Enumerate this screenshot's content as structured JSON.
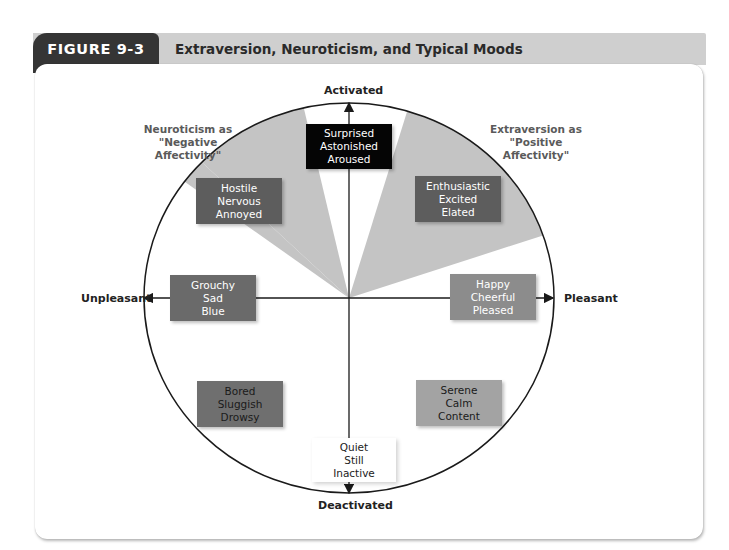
{
  "figure": {
    "number_label": "FIGURE 9-3",
    "title": "Extraversion, Neuroticism, and Typical Moods"
  },
  "axes": {
    "top": "Activated",
    "bottom": "Deactivated",
    "left": "Unpleasant",
    "right": "Pleasant"
  },
  "annotations": {
    "neuroticism": [
      "Neuroticism as",
      "\"Negative",
      "Affectivity\""
    ],
    "extraversion": [
      "Extraversion as",
      "\"Positive",
      "Affectivity\""
    ]
  },
  "mood_boxes": {
    "activated": {
      "words": [
        "Surprised",
        "Astonished",
        "Aroused"
      ],
      "fill": "#050505",
      "text": "#ffffff"
    },
    "negative_activated": {
      "words": [
        "Hostile",
        "Nervous",
        "Annoyed"
      ],
      "fill": "#5d5d5d",
      "text": "#ffffff"
    },
    "positive_activated": {
      "words": [
        "Enthusiastic",
        "Excited",
        "Elated"
      ],
      "fill": "#5d5d5d",
      "text": "#ffffff"
    },
    "unpleasant": {
      "words": [
        "Grouchy",
        "Sad",
        "Blue"
      ],
      "fill": "#6a6a6a",
      "text": "#ffffff"
    },
    "pleasant": {
      "words": [
        "Happy",
        "Cheerful",
        "Pleased"
      ],
      "fill": "#8c8c8c",
      "text": "#ffffff"
    },
    "negative_deactivated": {
      "words": [
        "Bored",
        "Sluggish",
        "Drowsy"
      ],
      "fill": "#6f6f6f",
      "text": "#1a1a1a"
    },
    "positive_deactivated": {
      "words": [
        "Serene",
        "Calm",
        "Content"
      ],
      "fill": "#a3a3a3",
      "text": "#1a1a1a"
    },
    "deactivated": {
      "words": [
        "Quiet",
        "Still",
        "Inactive"
      ],
      "fill": "#ffffff",
      "text": "#222222"
    }
  },
  "colors": {
    "tab": "#353535",
    "header_bar": "#cfcfcf",
    "wedge": "#c4c4c4",
    "line": "#1a1a1a"
  }
}
